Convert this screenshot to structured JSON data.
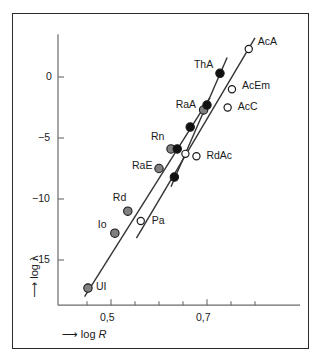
{
  "figure": {
    "kind": "geiger-nuttall-plot",
    "background": "#ffffff",
    "frame_color": "#2b2b2b",
    "axis_color": "#6b6b6b",
    "line_color": "#333333"
  },
  "axes": {
    "x": {
      "label_arrow": "⟶",
      "label_text": "log ",
      "label_italic": "R",
      "label_full": "⟶ log R",
      "tick_labels": [
        "0,5",
        "0,7"
      ],
      "tick_values": [
        0.5,
        0.7
      ],
      "minor_tick_values": [
        0.45,
        0.55,
        0.6,
        0.65,
        0.75,
        0.8
      ],
      "range": [
        0.43,
        0.82
      ]
    },
    "y": {
      "label_arrow": "⟶",
      "label_text": "log ",
      "label_symbol": "λ",
      "label_full": "⟶ log λ",
      "tick_labels": [
        "0",
        "−5",
        "−10",
        "−15"
      ],
      "tick_values": [
        0,
        -5,
        -10,
        -15
      ],
      "range": [
        -18.5,
        3.5
      ]
    }
  },
  "chart_data": {
    "type": "scatter",
    "title": "",
    "xlabel": "⟶ log R",
    "ylabel": "⟶ log λ",
    "xlim": [
      0.43,
      0.82
    ],
    "ylim": [
      -18.5,
      3.5
    ],
    "grid": false,
    "legend": "none",
    "xticks": [
      0.5,
      0.7
    ],
    "xticklabels": [
      "0,5",
      "0,7"
    ],
    "yticks": [
      0,
      -5,
      -10,
      -15
    ],
    "yticklabels": [
      "0",
      "−5",
      "−10",
      "−15"
    ],
    "series": [
      {
        "name": "uranium-radium-series",
        "marker": "filled-gray-circle",
        "color": "#808080",
        "points": [
          {
            "label": "UI",
            "x": 0.452,
            "y": -17.3
          },
          {
            "label": "Io",
            "x": 0.508,
            "y": -12.8
          },
          {
            "label": "Rd",
            "x": 0.535,
            "y": -11.0
          },
          {
            "label": "RaE",
            "x": 0.6,
            "y": -7.5
          },
          {
            "label": "Rn",
            "x": 0.625,
            "y": -5.9
          },
          {
            "label": "RaA",
            "x": 0.693,
            "y": -2.7
          }
        ],
        "line": {
          "x1": 0.445,
          "y1": -18.0,
          "x2": 0.706,
          "y2": -1.7
        }
      },
      {
        "name": "thorium-series",
        "marker": "filled-black-circle",
        "color": "#111111",
        "points": [
          {
            "label": "",
            "x": 0.632,
            "y": -8.2
          },
          {
            "label": "",
            "x": 0.638,
            "y": -5.9
          },
          {
            "label": "",
            "x": 0.665,
            "y": -4.1
          },
          {
            "label": "",
            "x": 0.7,
            "y": -2.3
          },
          {
            "label": "ThA",
            "x": 0.727,
            "y": 0.3
          }
        ],
        "line": {
          "x1": 0.625,
          "y1": -9.0,
          "x2": 0.742,
          "y2": 1.6
        }
      },
      {
        "name": "actinium-series",
        "marker": "open-circle",
        "color": "#ffffff",
        "points": [
          {
            "label": "Pa",
            "x": 0.562,
            "y": -11.8
          },
          {
            "label": "",
            "x": 0.655,
            "y": -6.3
          },
          {
            "label": "RdAc",
            "x": 0.678,
            "y": -6.5
          },
          {
            "label": "AcC",
            "x": 0.743,
            "y": -2.5
          },
          {
            "label": "AcEm",
            "x": 0.752,
            "y": -1.0
          },
          {
            "label": "AcA",
            "x": 0.787,
            "y": 2.3
          }
        ],
        "line": {
          "x1": 0.553,
          "y1": -13.2,
          "x2": 0.8,
          "y2": 3.2
        }
      }
    ],
    "point_labels": [
      "UI",
      "Io",
      "Rd",
      "Pa",
      "RaE",
      "Rn",
      "RdAc",
      "RaA",
      "ThA",
      "AcC",
      "AcEm",
      "AcA"
    ]
  }
}
